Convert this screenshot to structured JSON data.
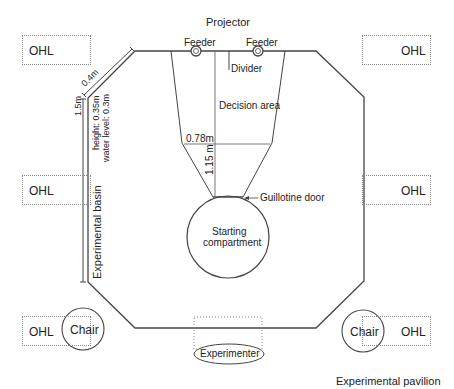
{
  "title": "Experimental pavilion",
  "projector_label": "Projector",
  "feeders": [
    {
      "label": "Feeder"
    },
    {
      "label": "Feeder"
    }
  ],
  "divider_label": "Divider",
  "decision_area_label": "Decision area",
  "width_label": "0.78m",
  "length_label": "1.15 m",
  "guillotine_label": "Guillotine door",
  "starting_compartment": {
    "line1": "Starting",
    "line2": "compartment"
  },
  "basin": {
    "label": "Experimental basin",
    "side_length": "1.5m",
    "diagonal_length": "0.4m",
    "height": "height: 0.35m",
    "water_level": "water level: 0.3m"
  },
  "ohl_label": "OHL",
  "chair_label": "Chair",
  "experimenter_label": "Experimenter",
  "colors": {
    "line": "#444444",
    "dotted": "#888888"
  }
}
